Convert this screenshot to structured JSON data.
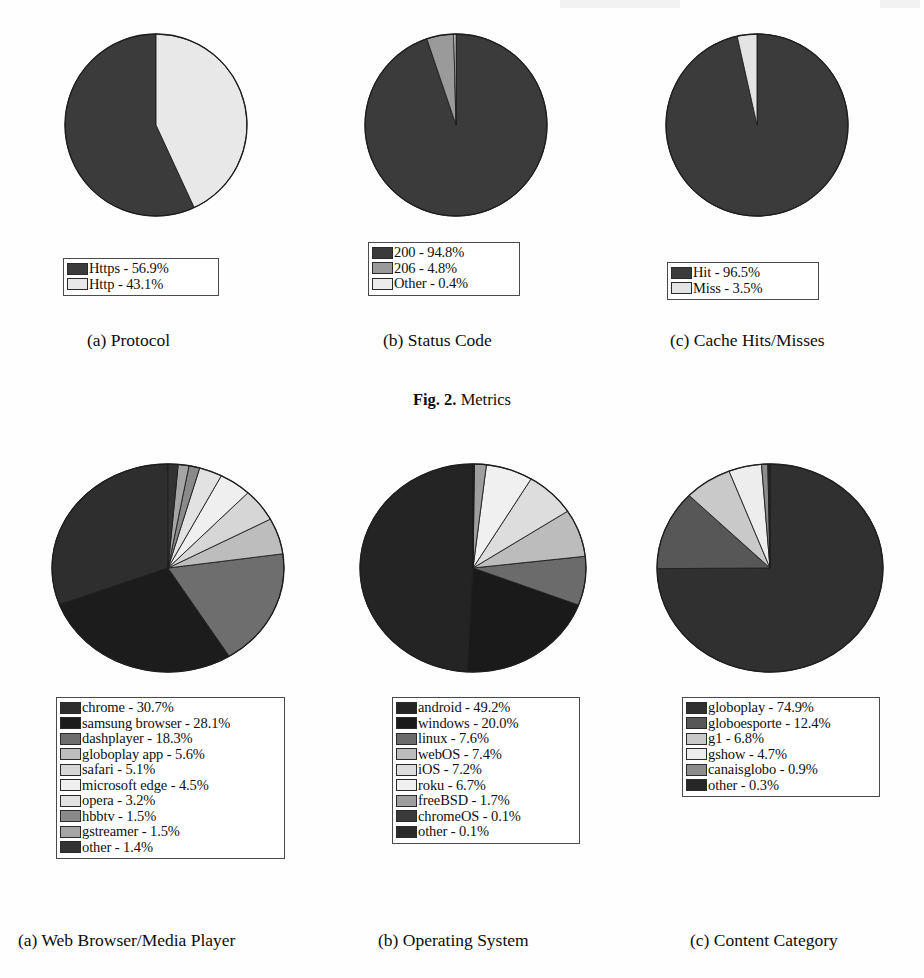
{
  "figure_top": {
    "caption_bold": "Fig. 2.",
    "caption_rest": " Metrics",
    "panels": [
      {
        "sub_label": "(a) Protocol",
        "legend": [
          {
            "label": "Https - 56.9%",
            "color": "#3b3b3b"
          },
          {
            "label": "Http - 43.1%",
            "color": "#e8e8e8"
          }
        ]
      },
      {
        "sub_label": "(b) Status Code",
        "legend": [
          {
            "label": "200 - 94.8%",
            "color": "#3b3b3b"
          },
          {
            "label": "206 - 4.8%",
            "color": "#9a9a9a"
          },
          {
            "label": "Other - 0.4%",
            "color": "#ececec"
          }
        ]
      },
      {
        "sub_label": "(c) Cache Hits/Misses",
        "legend": [
          {
            "label": "Hit - 96.5%",
            "color": "#3b3b3b"
          },
          {
            "label": "Miss - 3.5%",
            "color": "#e4e4e4"
          }
        ]
      }
    ]
  },
  "figure_bottom": {
    "panels": [
      {
        "sub_label": "(a) Web Browser/Media Player"
      },
      {
        "sub_label": "(b) Operating System"
      },
      {
        "sub_label": "(c) Content Category"
      }
    ]
  },
  "chart_data": [
    {
      "type": "pie",
      "title": "Protocol",
      "panel": "(a) Protocol",
      "figure": "Fig. 2. Metrics",
      "legend_position": "below-chart",
      "labels": [
        "Https",
        "Http"
      ],
      "values": [
        56.9,
        43.1
      ],
      "value_unit": "percent",
      "colors": [
        "#3b3b3b",
        "#e8e8e8"
      ],
      "start_angle_deg": 0,
      "direction": "counterclockwise",
      "legend_entries": [
        "Https - 56.9%",
        "Http - 43.1%"
      ]
    },
    {
      "type": "pie",
      "title": "Status Code",
      "panel": "(b) Status Code",
      "figure": "Fig. 2. Metrics",
      "legend_position": "below-chart",
      "labels": [
        "200",
        "206",
        "Other"
      ],
      "values": [
        94.8,
        4.8,
        0.4
      ],
      "value_unit": "percent",
      "colors": [
        "#3b3b3b",
        "#9a9a9a",
        "#ececec"
      ],
      "start_angle_deg": 0,
      "direction": "clockwise",
      "legend_entries": [
        "200 - 94.8%",
        "206 - 4.8%",
        "Other - 0.4%"
      ]
    },
    {
      "type": "pie",
      "title": "Cache Hits/Misses",
      "panel": "(c) Cache Hits/Misses",
      "figure": "Fig. 2. Metrics",
      "legend_position": "below-chart",
      "labels": [
        "Hit",
        "Miss"
      ],
      "values": [
        96.5,
        3.5
      ],
      "value_unit": "percent",
      "colors": [
        "#3b3b3b",
        "#e4e4e4"
      ],
      "start_angle_deg": 0,
      "direction": "clockwise",
      "legend_entries": [
        "Hit - 96.5%",
        "Miss - 3.5%"
      ]
    },
    {
      "type": "pie",
      "title": "Web Browser/Media Player",
      "panel": "(a) Web Browser/Media Player",
      "legend_position": "below-chart",
      "labels": [
        "chrome",
        "samsung browser",
        "dashplayer",
        "globoplay app",
        "safari",
        "microsoft edge",
        "opera",
        "hbbtv",
        "gstreamer",
        "other"
      ],
      "values": [
        30.7,
        28.1,
        18.3,
        5.6,
        5.1,
        4.5,
        3.2,
        1.5,
        1.5,
        1.4
      ],
      "value_unit": "percent",
      "colors": [
        "#2e2e2e",
        "#1c1c1c",
        "#6e6e6e",
        "#bdbdbd",
        "#d6d6d6",
        "#efefef",
        "#e2e2e2",
        "#8a8a8a",
        "#a5a5a5",
        "#333333"
      ],
      "start_angle_deg": 0,
      "direction": "counterclockwise",
      "legend_entries": [
        "chrome - 30.7%",
        "samsung browser - 28.1%",
        "dashplayer - 18.3%",
        "globoplay app - 5.6%",
        "safari - 5.1%",
        "microsoft edge - 4.5%",
        "opera - 3.2%",
        "hbbtv - 1.5%",
        "gstreamer - 1.5%",
        "other - 1.4%"
      ]
    },
    {
      "type": "pie",
      "title": "Operating System",
      "panel": "(b) Operating System",
      "legend_position": "below-chart",
      "labels": [
        "android",
        "windows",
        "linux",
        "webOS",
        "iOS",
        "roku",
        "freeBSD",
        "chromeOS",
        "other"
      ],
      "values": [
        49.2,
        20.0,
        7.6,
        7.4,
        7.2,
        6.7,
        1.7,
        0.1,
        0.1
      ],
      "value_unit": "percent",
      "colors": [
        "#242424",
        "#1a1a1a",
        "#6b6b6b",
        "#bcbcbc",
        "#dddddd",
        "#f0f0f0",
        "#9e9e9e",
        "#3a3a3a",
        "#2b2b2b"
      ],
      "start_angle_deg": 0,
      "direction": "counterclockwise",
      "legend_entries": [
        "android - 49.2%",
        "windows - 20.0%",
        "linux - 7.6%",
        "webOS - 7.4%",
        "iOS - 7.2%",
        "roku - 6.7%",
        "freeBSD - 1.7%",
        "chromeOS - 0.1%",
        "other - 0.1%"
      ]
    },
    {
      "type": "pie",
      "title": "Content Category",
      "panel": "(c) Content Category",
      "legend_position": "below-chart",
      "labels": [
        "globoplay",
        "globoesporte",
        "g1",
        "gshow",
        "canaisglobo",
        "other"
      ],
      "values": [
        74.9,
        12.4,
        6.8,
        4.7,
        0.9,
        0.3
      ],
      "value_unit": "percent",
      "colors": [
        "#303030",
        "#575757",
        "#c9c9c9",
        "#ededed",
        "#8c8c8c",
        "#262626"
      ],
      "start_angle_deg": 0,
      "direction": "clockwise",
      "legend_entries": [
        "globoplay - 74.9%",
        "globoesporte - 12.4%",
        "g1 - 6.8%",
        "gshow - 4.7%",
        "canaisglobo - 0.9%",
        "other - 0.3%"
      ]
    }
  ]
}
